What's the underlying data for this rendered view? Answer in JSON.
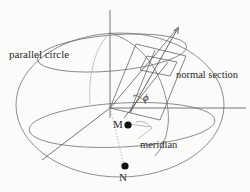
{
  "figure": {
    "background_color": "#fbfbf9",
    "line_color": "#4a4a4a",
    "faint_line_color": "#9a9a9a",
    "marker_color": "#101010",
    "labels": {
      "parallel_circle": "parallel circle",
      "normal_section": "normal section",
      "meridian": "meridian",
      "point_m": "M",
      "point_n": "N",
      "angle_phi": "ϕ"
    },
    "elements": {
      "sphere": "great-circle outline of the spheroid",
      "vertical_axis": "polar axis through centre",
      "horizontal_axis": "equatorial axis to the right",
      "parallel_circle_ellipse": "upper latitude circle drawn in perspective",
      "equator_ellipse": "lower latitude circle drawn in perspective",
      "normal_section_plane": "tilted parallelogram cutting the sphere",
      "normal_arrow": "outward arrow along the surface normal",
      "angle_arc": "arc marking the angle phi at the normal",
      "dotted_drop_line": "dotted line from centre down to N"
    }
  }
}
